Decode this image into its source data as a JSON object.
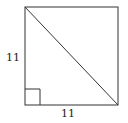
{
  "figure": {
    "shape": "square",
    "labels": {
      "left_side": "11",
      "bottom_side": "11"
    },
    "has_diagonal": true,
    "diagonal": "top-left to bottom-right",
    "right_angle_marker": "bottom-left",
    "stroke_color": "#333333"
  }
}
